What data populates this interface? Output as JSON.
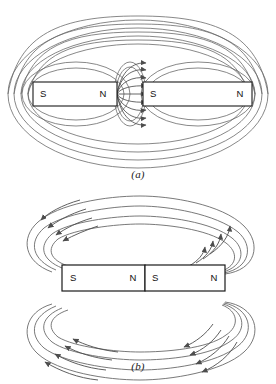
{
  "figure": {
    "background_color": "#ffffff",
    "line_color": "#5a5a5a",
    "magnet_outline_color": "#1a1a1a",
    "magnet_fill_color": "#ffffff",
    "text_color": "#111111",
    "width": 276,
    "height": 384
  },
  "panels": [
    {
      "id": "a",
      "caption": "(a)",
      "description": "Two bar magnets separated by a gap, unlike poles facing (N facing S); field lines run straight across the gap and large loops enclose both magnets",
      "magnets": [
        {
          "id": "left-magnet",
          "left_pole": "S",
          "right_pole": "N",
          "x": 33,
          "y": 82,
          "width": 84,
          "height": 24
        },
        {
          "id": "right-magnet",
          "left_pole": "S",
          "right_pole": "N",
          "x": 143,
          "y": 82,
          "width": 109,
          "height": 24
        }
      ],
      "gap_field": {
        "id": "gap-field-lines",
        "line_count": 9,
        "arrow_direction": "right",
        "from_pole": "N",
        "to_pole": "S",
        "center_x": 130,
        "center_y": 94
      },
      "outer_loops": 4,
      "inner_loops_per_magnet": 2
    },
    {
      "id": "b",
      "caption": "(b)",
      "description": "Two bar magnets in contact, like arrangement N against S; field lines loop from the far N pole over the top and bottom back to the far S pole",
      "magnets": [
        {
          "id": "left-magnet",
          "left_pole": "S",
          "right_pole": "N",
          "x": 62,
          "y": 265,
          "width": 83,
          "height": 26
        },
        {
          "id": "right-magnet",
          "left_pole": "S",
          "right_pole": "N",
          "x": 145,
          "y": 265,
          "width": 80,
          "height": 26
        }
      ],
      "upper_loops": 4,
      "lower_loops": 4,
      "arrow_direction_top": "leftward-over-top",
      "arrow_direction_bottom": "leftward-under-bottom"
    }
  ]
}
